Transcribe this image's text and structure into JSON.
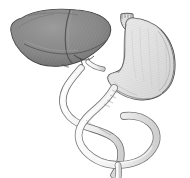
{
  "figure": {
    "style": "grayscale engraving line drawing",
    "background_color": "#ffffff",
    "width": 190,
    "height": 178
  },
  "palette": {
    "background": "#ffffff",
    "liver_fill": "#8d8d8d",
    "liver_fill_dark": "#767676",
    "liver_fill_light": "#9a9a9a",
    "liver_outline": "#3a3a3a",
    "stomach_fill": "#e2e2e2",
    "stomach_fill_shadow": "#cfcfcf",
    "stomach_outline": "#4a4a4a",
    "duct_fill": "#f1f1f1",
    "duct_fill_shadow": "#d8d8d8",
    "duct_outline": "#6b6b6b",
    "hatch_stroke": "#5e5e5e"
  },
  "structures": [
    {
      "id": "liver",
      "label": "Liver",
      "sublabel": "Hepar",
      "tone": "dark gray",
      "position": "upper left"
    },
    {
      "id": "liver-right-lobe",
      "label": "Right lobe of liver",
      "tone": "dark gray",
      "position": "left"
    },
    {
      "id": "liver-left-lobe",
      "label": "Left lobe of liver",
      "tone": "dark gray",
      "position": "center upper"
    },
    {
      "id": "stomach",
      "label": "Stomach",
      "sublabel": "Gaster",
      "tone": "light gray",
      "position": "upper right"
    },
    {
      "id": "esophagus",
      "label": "Esophagus stump",
      "tone": "light gray",
      "position": "top center-right"
    },
    {
      "id": "cystic-duct",
      "label": "Cystic duct",
      "tone": "pale",
      "position": "center"
    },
    {
      "id": "common-bile-duct",
      "label": "Common bile duct",
      "tone": "pale",
      "position": "center"
    },
    {
      "id": "duodenum",
      "label": "Duodenum",
      "tone": "pale",
      "position": "center lower"
    },
    {
      "id": "duodenal-loop",
      "label": "Duodenal loop",
      "tone": "pale",
      "position": "lower center"
    },
    {
      "id": "pancreatic-duct",
      "label": "Pancreatic duct",
      "tone": "pale",
      "position": "lower center"
    },
    {
      "id": "jejunum",
      "label": "Jejunum",
      "tone": "pale",
      "position": "bottom"
    }
  ],
  "annotations": {
    "has_text_labels": false,
    "label_count": 0
  }
}
